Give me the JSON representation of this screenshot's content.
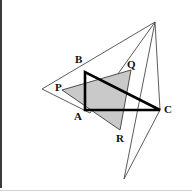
{
  "figure": {
    "background_color": "#ffffff",
    "canvas": {
      "width": 192,
      "height": 196
    },
    "frame": {
      "left_border_color": "#3a3a3a",
      "bottom_border_color": "#d2d2d2"
    },
    "labels": [
      {
        "id": "A",
        "text": "A",
        "x": 74,
        "y": 111
      },
      {
        "id": "B",
        "text": "B",
        "x": 75,
        "y": 54
      },
      {
        "id": "C",
        "text": "C",
        "x": 164,
        "y": 104
      },
      {
        "id": "P",
        "text": "P",
        "x": 55,
        "y": 82
      },
      {
        "id": "Q",
        "text": "Q",
        "x": 127,
        "y": 59
      },
      {
        "id": "R",
        "text": "R",
        "x": 116,
        "y": 133
      }
    ],
    "shapes": {
      "bold_triangle": {
        "name": "triangle-abc",
        "points": "85,72 85,110 160,110",
        "stroke": "#000000",
        "stroke_width": 2.6,
        "fill": "none",
        "vertices": {
          "A": [
            85,
            110
          ],
          "B": [
            85,
            72
          ],
          "C": [
            160,
            110
          ]
        }
      },
      "shaded_triangle": {
        "name": "triangle-pqr",
        "points": "62,90 131,70 120,130",
        "fill": "#c9c9c9",
        "stroke": "#3c3c3c",
        "stroke_width": 0.9,
        "vertices": {
          "P": [
            62,
            90
          ],
          "Q": [
            131,
            70
          ],
          "R": [
            120,
            130
          ]
        }
      },
      "outer_triangle": {
        "name": "outer-thin-triangle",
        "points": "155,22 124,179 160,110",
        "stroke": "#4a4a4a",
        "stroke_width": 0.9,
        "fill": "none"
      },
      "left_thin_triangle": {
        "name": "left-thin-triangle",
        "points": "42,89 155,22 90,113",
        "stroke": "#4a4a4a",
        "stroke_width": 0.9,
        "fill": "none"
      }
    }
  }
}
